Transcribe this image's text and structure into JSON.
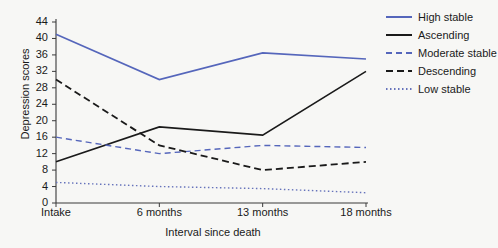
{
  "chart_data": {
    "type": "line",
    "title": "",
    "xlabel": "Interval since death",
    "ylabel": "Depression scores",
    "categories": [
      "Intake",
      "6 months",
      "13 months",
      "18 months"
    ],
    "ylim": [
      0,
      44
    ],
    "yticks": [
      0,
      4,
      8,
      12,
      16,
      20,
      24,
      28,
      32,
      36,
      40,
      44
    ],
    "grid": false,
    "legend_position": "right",
    "series": [
      {
        "name": "High stable",
        "values": [
          41,
          30,
          36.5,
          35
        ],
        "color": "#5566bb",
        "style": "solid",
        "width": 1.6
      },
      {
        "name": "Ascending",
        "values": [
          10,
          18.5,
          16.5,
          32
        ],
        "color": "#1a1a1a",
        "style": "solid",
        "width": 1.6
      },
      {
        "name": "Moderate stable",
        "values": [
          16,
          12,
          14,
          13.5
        ],
        "color": "#5566bb",
        "style": "dashed",
        "width": 1.4
      },
      {
        "name": "Descending",
        "values": [
          30,
          14,
          8,
          10
        ],
        "color": "#1a1a1a",
        "style": "dashed",
        "width": 1.8
      },
      {
        "name": "Low stable",
        "values": [
          5,
          4,
          3.5,
          2.5
        ],
        "color": "#6673bb",
        "style": "dotted",
        "width": 1.4
      }
    ]
  },
  "axes": {
    "y_title": "Depression scores",
    "x_title": "Interval since death",
    "y_tick_labels": [
      "44",
      "40",
      "36",
      "32",
      "28",
      "24",
      "20",
      "16",
      "12",
      "8",
      "4",
      "0"
    ],
    "x_tick_labels": [
      "Intake",
      "6 months",
      "13 months",
      "18 months"
    ]
  },
  "legend": {
    "items": [
      {
        "label": "High stable"
      },
      {
        "label": "Ascending"
      },
      {
        "label": "Moderate stable"
      },
      {
        "label": "Descending"
      },
      {
        "label": "Low stable"
      }
    ]
  },
  "colors": {
    "blue": "#5566bb",
    "black": "#1a1a1a",
    "axis": "#3a3a3a",
    "background": "#f7f7f5"
  }
}
